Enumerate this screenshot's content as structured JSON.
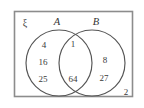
{
  "figure": {
    "type": "venn-diagram",
    "universe_symbol": "ξ",
    "background_color": "#ffffff",
    "frame_color": "#8c8c8c",
    "circle_color": "#555555",
    "text_color": "#3a3a3a"
  },
  "sets": {
    "left": {
      "label": "A"
    },
    "right": {
      "label": "B"
    }
  },
  "regions": {
    "a_only": {
      "name": "A only",
      "elements": [
        {
          "value": "4",
          "x": 44,
          "y": 48
        },
        {
          "value": "16",
          "x": 43,
          "y": 65
        },
        {
          "value": "25",
          "x": 43,
          "y": 82
        }
      ]
    },
    "intersection": {
      "name": "A and B",
      "elements": [
        {
          "value": "1",
          "x": 73,
          "y": 47
        },
        {
          "value": "64",
          "x": 73,
          "y": 82
        }
      ]
    },
    "b_only": {
      "name": "B only",
      "elements": [
        {
          "value": "8",
          "x": 105,
          "y": 63
        },
        {
          "value": "27",
          "x": 104,
          "y": 81
        }
      ]
    },
    "outside": {
      "name": "Outside both sets",
      "elements": [
        {
          "value": "2",
          "x": 126,
          "y": 95
        }
      ]
    }
  }
}
